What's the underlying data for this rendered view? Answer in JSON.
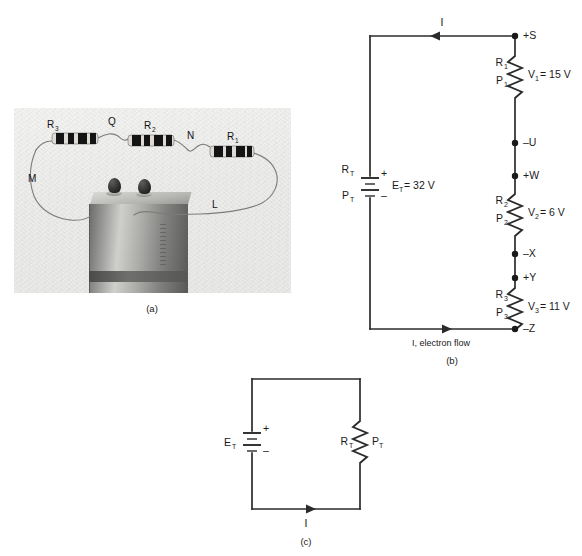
{
  "figure": {
    "panels": [
      {
        "id": "a",
        "caption": "(a)",
        "type": "photograph",
        "description": "three resistors wired in series to a battery",
        "labels": [
          {
            "name": "R3",
            "base": "R",
            "sub": "3"
          },
          {
            "name": "Q",
            "base": "Q",
            "sub": ""
          },
          {
            "name": "R2",
            "base": "R",
            "sub": "2"
          },
          {
            "name": "N",
            "base": "N",
            "sub": ""
          },
          {
            "name": "R1",
            "base": "R",
            "sub": "1"
          },
          {
            "name": "M",
            "base": "M",
            "sub": ""
          },
          {
            "name": "L",
            "base": "L",
            "sub": ""
          }
        ]
      },
      {
        "id": "b",
        "caption": "(b)",
        "type": "series-circuit-schematic",
        "source": {
          "name": "battery",
          "resistance_label_base": "R",
          "resistance_label_sub": "T",
          "power_label_base": "P",
          "power_label_sub": "T",
          "emf_base": "E",
          "emf_sub": "T",
          "emf_value": "= 32 V",
          "plus": "+",
          "minus": "–"
        },
        "top_current": {
          "symbol": "I",
          "direction": "left"
        },
        "bottom_current": {
          "symbol": "I, electron flow",
          "direction": "right"
        },
        "resistors": [
          {
            "r_base": "R",
            "r_sub": "1",
            "p_base": "P",
            "p_sub": "1",
            "v_base": "V",
            "v_sub": "1",
            "v_value": "= 15 V"
          },
          {
            "r_base": "R",
            "r_sub": "2",
            "p_base": "P",
            "p_sub": "2",
            "v_base": "V",
            "v_sub": "2",
            "v_value": "= 6 V"
          },
          {
            "r_base": "R",
            "r_sub": "3",
            "p_base": "P",
            "p_sub": "3",
            "v_base": "V",
            "v_sub": "3",
            "v_value": "= 11 V"
          }
        ],
        "nodes": [
          {
            "label": "+S",
            "polarity": "+",
            "point": "S"
          },
          {
            "label": "–U",
            "polarity": "–",
            "point": "U"
          },
          {
            "label": "+W",
            "polarity": "+",
            "point": "W"
          },
          {
            "label": "–X",
            "polarity": "–",
            "point": "X"
          },
          {
            "label": "+Y",
            "polarity": "+",
            "point": "Y"
          },
          {
            "label": "–Z",
            "polarity": "–",
            "point": "Z"
          }
        ]
      },
      {
        "id": "c",
        "caption": "(c)",
        "type": "equivalent-circuit-schematic",
        "source": {
          "emf_base": "E",
          "emf_sub": "T",
          "plus": "+",
          "minus": "–"
        },
        "load": {
          "r_base": "R",
          "r_sub": "T",
          "p_base": "P",
          "p_sub": "T"
        },
        "bottom_current": {
          "symbol": "I",
          "direction": "right"
        }
      }
    ]
  },
  "colors": {
    "ink": "#1a1a1a",
    "wire": "#2b2b2b",
    "page_background": "#ffffff",
    "photo_background": "#eeeeec"
  }
}
